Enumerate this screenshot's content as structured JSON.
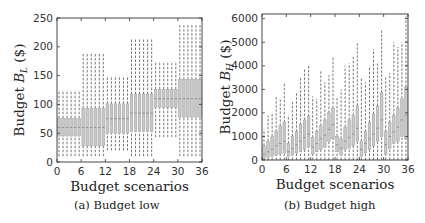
{
  "chart_data": [
    {
      "type": "boxplot",
      "title": "",
      "caption": "(a) Budget low",
      "xlabel": "Budget scenarios",
      "ylabel_prefix": "Budget ",
      "ylabel_var": "B",
      "ylabel_sub": "L",
      "ylabel_suffix": " ($)",
      "xlim": [
        0,
        36
      ],
      "ylim": [
        0,
        250
      ],
      "xticks": [
        0,
        6,
        12,
        18,
        24,
        30,
        36
      ],
      "yticks": [
        0,
        50,
        100,
        150,
        200,
        250
      ],
      "grid": false,
      "legend": null,
      "box_color": "#c8c8c8",
      "whisker_style": "dashed",
      "groups": [
        {
          "scenarios": [
            1,
            2,
            3,
            4,
            5,
            6
          ],
          "whisker_low": 10,
          "q1": 45,
          "median": 60,
          "q3": 76,
          "whisker_high": 125
        },
        {
          "scenarios": [
            7,
            8,
            9,
            10,
            11,
            12
          ],
          "whisker_low": 10,
          "q1": 28,
          "median": 60,
          "q3": 93,
          "whisker_high": 190
        },
        {
          "scenarios": [
            13,
            14,
            15,
            16,
            17,
            18
          ],
          "whisker_low": 20,
          "q1": 50,
          "median": 75,
          "q3": 101,
          "whisker_high": 150
        },
        {
          "scenarios": [
            19,
            20,
            21,
            22,
            23,
            24
          ],
          "whisker_low": 10,
          "q1": 53,
          "median": 85,
          "q3": 118,
          "whisker_high": 215
        },
        {
          "scenarios": [
            25,
            26,
            27,
            28,
            29,
            30
          ],
          "whisker_low": 43,
          "q1": 95,
          "median": 110,
          "q3": 126,
          "whisker_high": 175
        },
        {
          "scenarios": [
            31,
            32,
            33,
            34,
            35,
            36
          ],
          "whisker_low": 10,
          "q1": 78,
          "median": 110,
          "q3": 143,
          "whisker_high": 240
        }
      ]
    },
    {
      "type": "boxplot",
      "title": "",
      "caption": "(b) Budget high",
      "xlabel": "Budget scenarios",
      "ylabel_prefix": "Budget ",
      "ylabel_var": "B",
      "ylabel_sub": "H",
      "ylabel_suffix": " ($)",
      "xlim": [
        0,
        36
      ],
      "ylim": [
        0,
        6200
      ],
      "xticks": [
        0,
        6,
        12,
        18,
        24,
        30,
        36
      ],
      "yticks": [
        0,
        1000,
        2000,
        3000,
        4000,
        5000,
        6000
      ],
      "grid": false,
      "legend": null,
      "box_color": "#c8c8c8",
      "whisker_style": "dashed",
      "x": [
        1,
        2,
        3,
        4,
        5,
        6,
        7,
        8,
        9,
        10,
        11,
        12,
        13,
        14,
        15,
        16,
        17,
        18,
        19,
        20,
        21,
        22,
        23,
        24,
        25,
        26,
        27,
        28,
        29,
        30,
        31,
        32,
        33,
        34,
        35,
        36
      ],
      "whisker_low": [
        0,
        0,
        0,
        0,
        0,
        0,
        0,
        0,
        0,
        0,
        0,
        0,
        0,
        0,
        0,
        0,
        0,
        0,
        0,
        0,
        0,
        0,
        0,
        0,
        0,
        0,
        0,
        0,
        0,
        0,
        0,
        0,
        0,
        0,
        0,
        0
      ],
      "q1": [
        80,
        120,
        160,
        200,
        250,
        300,
        150,
        200,
        300,
        350,
        450,
        550,
        250,
        350,
        450,
        550,
        800,
        900,
        350,
        200,
        450,
        500,
        600,
        800,
        150,
        300,
        450,
        600,
        800,
        1000,
        250,
        500,
        700,
        800,
        1000,
        900
      ],
      "median": [
        250,
        350,
        450,
        600,
        700,
        800,
        350,
        500,
        650,
        800,
        950,
        1100,
        550,
        700,
        900,
        1050,
        1300,
        1500,
        650,
        500,
        800,
        950,
        1100,
        1350,
        450,
        700,
        900,
        1100,
        1350,
        1700,
        650,
        1000,
        1200,
        1400,
        1700,
        1900
      ],
      "q3": [
        600,
        800,
        1000,
        1200,
        1450,
        1600,
        700,
        1000,
        1200,
        1500,
        1700,
        1850,
        950,
        1200,
        1450,
        1700,
        2000,
        2200,
        1000,
        900,
        1400,
        1700,
        1900,
        2300,
        800,
        1200,
        1600,
        1950,
        2300,
        2850,
        1200,
        1600,
        1900,
        2200,
        2600,
        3100
      ],
      "whisker_high": [
        1300,
        1900,
        2000,
        2700,
        2600,
        3300,
        1900,
        2500,
        2900,
        3500,
        3900,
        4000,
        2700,
        2600,
        3800,
        3300,
        3600,
        4400,
        2700,
        3000,
        4000,
        4100,
        4400,
        5000,
        3500,
        3300,
        4000,
        4700,
        4100,
        5500,
        3500,
        3700,
        5000,
        4800,
        5000,
        6100
      ]
    }
  ]
}
